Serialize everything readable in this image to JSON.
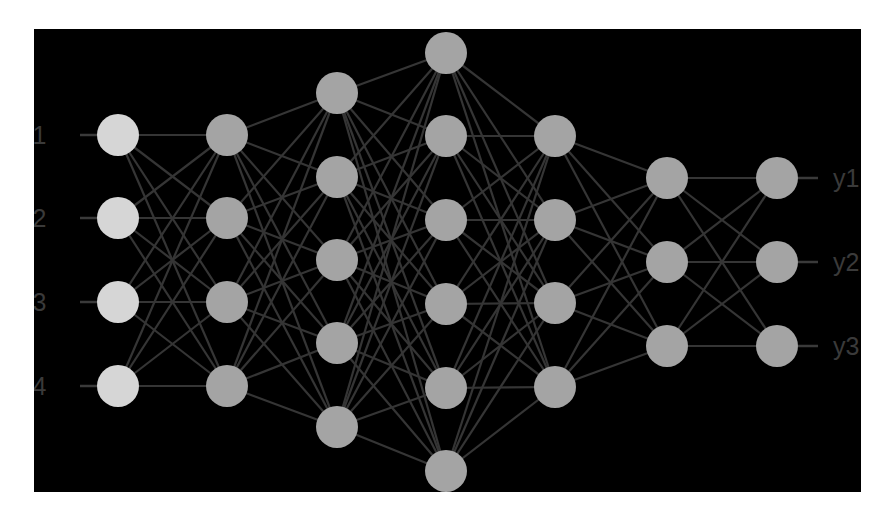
{
  "diagram": {
    "title": "",
    "type": "feed-forward neural network",
    "colors": {
      "page_background": "#ffffff",
      "panel_background": "#000000",
      "input_node": "#d6d6d6",
      "hidden_node": "#a4a4a4",
      "output_node": "#a4a4a4",
      "edge": "#353535",
      "stub": "#3a3a3a",
      "label": "#3a3a3a"
    },
    "node_radius": 21,
    "layers": [
      {
        "name": "input",
        "x": 118,
        "ys": [
          135,
          218,
          302,
          386
        ],
        "kind": "input"
      },
      {
        "name": "hidden-1",
        "x": 227,
        "ys": [
          135,
          218,
          302,
          386
        ],
        "kind": "hidden"
      },
      {
        "name": "hidden-2",
        "x": 337,
        "ys": [
          93,
          177,
          260,
          343,
          427
        ],
        "kind": "hidden"
      },
      {
        "name": "hidden-3",
        "x": 446,
        "ys": [
          53,
          136,
          220,
          304,
          388,
          471
        ],
        "kind": "hidden"
      },
      {
        "name": "hidden-4",
        "x": 555,
        "ys": [
          136,
          220,
          303,
          387
        ],
        "kind": "hidden"
      },
      {
        "name": "hidden-5",
        "x": 667,
        "ys": [
          178,
          262,
          346
        ],
        "kind": "hidden"
      },
      {
        "name": "output",
        "x": 777,
        "ys": [
          178,
          262,
          346
        ],
        "kind": "output"
      }
    ],
    "inputs": [
      {
        "label": "x1"
      },
      {
        "label": "x2"
      },
      {
        "label": "x3"
      },
      {
        "label": "x4"
      }
    ],
    "outputs": [
      {
        "label": "y1"
      },
      {
        "label": "y2"
      },
      {
        "label": "y3"
      }
    ],
    "input_label_x": 20,
    "input_stub": {
      "x1": 80,
      "x2": 97
    },
    "output_label_x": 833,
    "output_stub": {
      "x1": 798,
      "x2": 818
    }
  }
}
